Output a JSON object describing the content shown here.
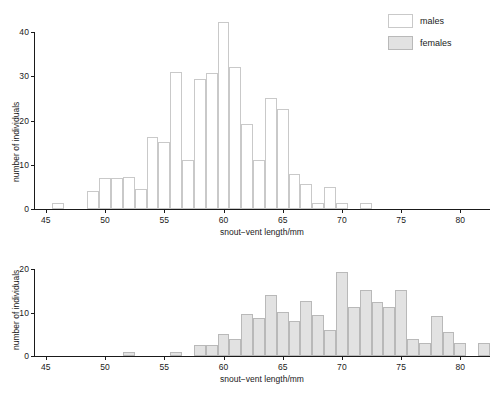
{
  "figure": {
    "background": "#ffffff",
    "males_fill": "#ffffff",
    "males_edge": "#c9c9c9",
    "females_fill": "#e2e2e2",
    "females_edge": "#b9b9b9",
    "axis_color": "#1a1a1a"
  },
  "legend": {
    "position": "top-right",
    "entries": [
      {
        "label": "males",
        "style": "males"
      },
      {
        "label": "females",
        "style": "females"
      }
    ]
  },
  "chart_data": [
    {
      "type": "bar",
      "id": "males-histogram",
      "title": "",
      "xlabel": "snout−vent length/mm",
      "ylabel": "number of individuals",
      "series_name": "males",
      "xlim": [
        44.0,
        82.5
      ],
      "ylim": [
        0,
        42.5
      ],
      "xticks": [
        45,
        50,
        55,
        60,
        65,
        70,
        75,
        80
      ],
      "yticks": [
        0,
        10,
        20,
        30,
        40
      ],
      "grid": false,
      "bin_width": 1,
      "categories": [
        46,
        49,
        50,
        51,
        52,
        53,
        54,
        55,
        56,
        57,
        58,
        59,
        60,
        61,
        62,
        63,
        64,
        65,
        66,
        67,
        68,
        69,
        70,
        72
      ],
      "values": [
        1.3,
        4,
        7,
        7,
        7.2,
        4.5,
        16.2,
        15.2,
        31,
        11,
        29.5,
        30.7,
        42.3,
        32.2,
        19.3,
        11,
        25.2,
        22.7,
        8,
        5.7,
        1.3,
        5,
        1.3,
        1.3
      ]
    },
    {
      "type": "bar",
      "id": "females-histogram",
      "title": "",
      "xlabel": "snout−vent length/mm",
      "ylabel": "number of individuals",
      "series_name": "females",
      "xlim": [
        44.0,
        82.5
      ],
      "ylim": [
        0,
        20.5
      ],
      "xticks": [
        45,
        50,
        55,
        60,
        65,
        70,
        75,
        80
      ],
      "yticks": [
        0,
        10,
        20
      ],
      "grid": false,
      "bin_width": 1,
      "categories": [
        52,
        56,
        58,
        59,
        60,
        61,
        62,
        63,
        64,
        65,
        66,
        67,
        68,
        69,
        70,
        71,
        72,
        73,
        74,
        75,
        76,
        77,
        78,
        79,
        80,
        82
      ],
      "values": [
        1,
        1,
        2.5,
        2.5,
        5,
        4,
        9.7,
        8.8,
        14,
        10.1,
        8.1,
        12.6,
        9.4,
        6.1,
        19.3,
        11.3,
        15.3,
        12.4,
        11.4,
        15.3,
        4,
        3,
        9.3,
        5.5,
        3,
        3
      ]
    }
  ]
}
